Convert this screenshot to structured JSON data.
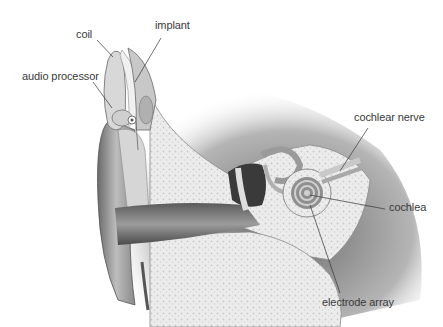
{
  "labels": {
    "coil": "coil",
    "implant": "implant",
    "audio_processor": "audio processor",
    "cochlear_nerve": "cochlear nerve",
    "cochlea": "cochlea",
    "electrode_array": "electrode array"
  },
  "colors": {
    "background": "#ffffff",
    "label_text": "#3a3a3a",
    "leader_line": "#333333",
    "bone": "#e8e8e8",
    "tissue_dark": "#4a4a4a",
    "tissue_mid": "#9a9a9a",
    "skin": "#c8c8c8"
  }
}
